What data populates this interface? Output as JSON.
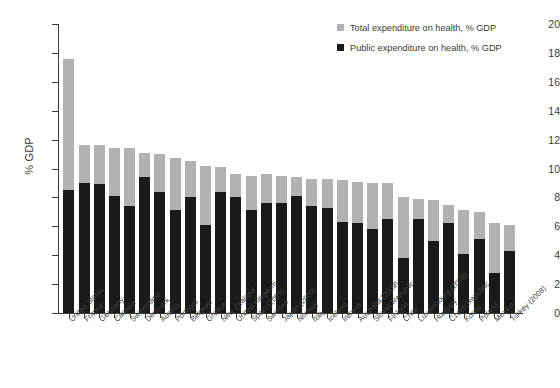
{
  "chart_data": {
    "type": "bar",
    "title": "",
    "subtitle": "",
    "xlabel": "",
    "ylabel": "% GDP",
    "ylim": [
      0,
      20
    ],
    "yticks": [
      0,
      2,
      4,
      6,
      8,
      10,
      12,
      14,
      16,
      18,
      20
    ],
    "grid": false,
    "stacked": true,
    "legend_position": "top-right",
    "categories": [
      "United States",
      "France",
      "Germany",
      "Canada",
      "Switzerland",
      "Denmark",
      "Austria",
      "Portugal",
      "Belgium",
      "Greece",
      "New Zealand",
      "United Kingdom",
      "Spain (2009)",
      "Sweden",
      "Japan (2009)",
      "Norway",
      "Italy",
      "Iceland",
      "Ireland",
      "Australia (2009)",
      "Slovak Republic",
      "Finland",
      "Chile",
      "Luxembourg (2009)",
      "Hungary",
      "Czech Republic",
      "Korea",
      "Poland",
      "Mexico",
      "Turkey (2008)"
    ],
    "series": [
      {
        "name": "Total expenditure on health, % GDP",
        "color": "#b2b2b2",
        "values": [
          17.6,
          11.6,
          11.6,
          11.4,
          11.4,
          11.1,
          11.0,
          10.7,
          10.5,
          10.2,
          10.1,
          9.6,
          9.5,
          9.6,
          9.5,
          9.4,
          9.3,
          9.3,
          9.2,
          9.1,
          9.0,
          9.0,
          8.0,
          7.9,
          7.8,
          7.5,
          7.1,
          7.0,
          6.2,
          6.1
        ]
      },
      {
        "name": "Public expenditure on health, % GDP",
        "color": "#1a1a1a",
        "values": [
          8.5,
          9.0,
          8.9,
          8.1,
          7.4,
          9.4,
          8.4,
          7.1,
          8.0,
          6.1,
          8.4,
          8.0,
          7.1,
          7.6,
          7.6,
          8.1,
          7.4,
          7.3,
          6.3,
          6.2,
          5.8,
          6.5,
          3.8,
          6.5,
          5.0,
          6.2,
          4.1,
          5.1,
          2.8,
          4.3
        ]
      }
    ]
  },
  "legend": {
    "items": [
      {
        "label": "Total expenditure on health, % GDP",
        "color": "#b2b2b2"
      },
      {
        "label": "Public expenditure on health, % GDP",
        "color": "#1a1a1a"
      }
    ]
  }
}
